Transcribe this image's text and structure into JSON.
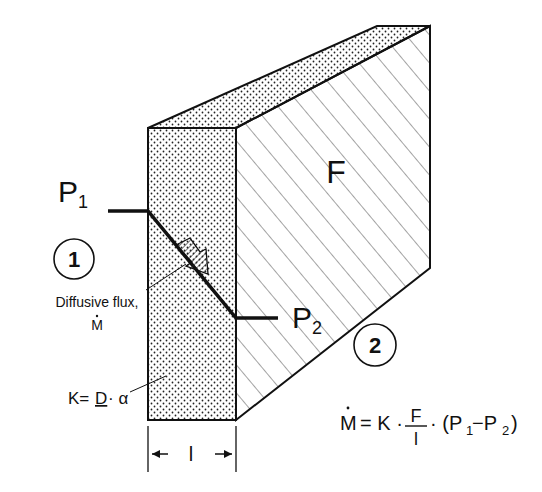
{
  "diagram": {
    "type": "diffusion-through-membrane",
    "labels": {
      "p1": "P",
      "p1_sub": "1",
      "p2": "P",
      "p2_sub": "2",
      "region1": "1",
      "region2": "2",
      "area": "F",
      "flux_line1": "Diffusive flux,",
      "flux_line2": "M",
      "k_prefix": "K=",
      "k_d": "D",
      "k_suffix": "· α",
      "thickness": "l"
    },
    "equation": {
      "lhs": "M",
      "eq": "= K ·",
      "frac_num": "F",
      "frac_den": "l",
      "rhs_open": "· (P",
      "rhs_sub1": "1",
      "rhs_mid": "−P",
      "rhs_sub2": "2",
      "rhs_close": ")"
    },
    "colors": {
      "ink": "#111111",
      "background": "#ffffff"
    }
  }
}
